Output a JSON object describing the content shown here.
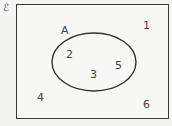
{
  "diagram": {
    "type": "venn",
    "universal_symbol": "ℰ",
    "set": {
      "name": "A",
      "elements": [
        "2",
        "3",
        "5"
      ]
    },
    "outside_elements": [
      "1",
      "4",
      "6"
    ]
  }
}
